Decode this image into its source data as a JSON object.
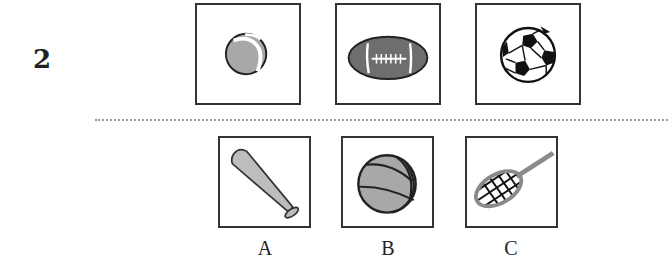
{
  "question": {
    "number": "2",
    "prompt_items": [
      {
        "id": "tennis-ball",
        "label": "tennis ball"
      },
      {
        "id": "american-football",
        "label": "american football"
      },
      {
        "id": "soccer-ball",
        "label": "soccer ball"
      }
    ],
    "options": [
      {
        "letter": "A",
        "item": "baseball bat"
      },
      {
        "letter": "B",
        "item": "basketball"
      },
      {
        "letter": "C",
        "item": "tennis racket"
      }
    ]
  },
  "colors": {
    "border": "#333333",
    "fill_gray": "#a8a8a8",
    "football_fill": "#6e6e6e",
    "racket_frame": "#8a8a8a",
    "divider": "#9a9a9a"
  }
}
